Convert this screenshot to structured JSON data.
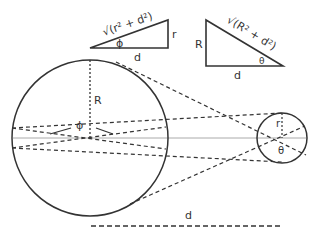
{
  "diagram": {
    "colors": {
      "stroke": "#333333",
      "axis": "#aaaaaa",
      "background": "#ffffff"
    },
    "small_triangle": {
      "hypotenuse_label": "√(r² + d²)",
      "side_label": "r",
      "base_label": "d",
      "angle_label": "ϕ"
    },
    "large_triangle": {
      "hypotenuse_label": "√(R² + d²)",
      "side_label": "R",
      "base_label": "d",
      "angle_label": "θ"
    },
    "large_circle": {
      "radius_label": "R",
      "angle_label": "ϕ"
    },
    "small_circle": {
      "radius_label": "r",
      "angle_label": "θ"
    },
    "distance": {
      "label": "d"
    }
  }
}
